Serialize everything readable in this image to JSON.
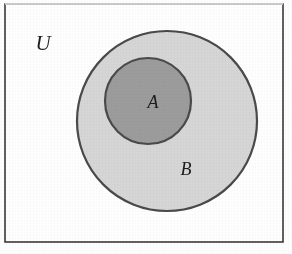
{
  "figure": {
    "kind": "venn-diagram",
    "canvas": {
      "width": 292,
      "height": 254
    },
    "background_color": "#fefefe"
  },
  "frame": {
    "name": "universal-set-rectangle",
    "x": 5,
    "y": 4,
    "width": 278,
    "height": 238,
    "stroke_color": "#3a3a3a",
    "stroke_width": 1.6,
    "top_stroke_color": "#c9c9c9",
    "fill_color": "#fefefe"
  },
  "labels": {
    "universe": {
      "text": "U",
      "x": 43,
      "y": 45,
      "color": "#1c1c1c"
    },
    "set_a": {
      "text": "A",
      "x": 153,
      "y": 104,
      "color": "#1c1c1c"
    },
    "set_b": {
      "text": "B",
      "x": 186,
      "y": 171,
      "color": "#1c1c1c"
    }
  },
  "sets": [
    {
      "name": "set-b-circle",
      "label": "B",
      "cx": 167,
      "cy": 121,
      "r": 90,
      "fill_color": "#d6d6d6",
      "stroke_color": "#4a4a4a",
      "stroke_width": 2.2
    },
    {
      "name": "set-a-circle",
      "label": "A",
      "cx": 148,
      "cy": 101,
      "r": 43,
      "fill_color": "#9c9c9c",
      "stroke_color": "#4a4a4a",
      "stroke_width": 2.2
    }
  ],
  "colors": {
    "ink": "#1c1c1c",
    "outline": "#4a4a4a",
    "set_a_fill": "#9c9c9c",
    "set_b_fill": "#d6d6d6",
    "paper": "#fefefe"
  }
}
